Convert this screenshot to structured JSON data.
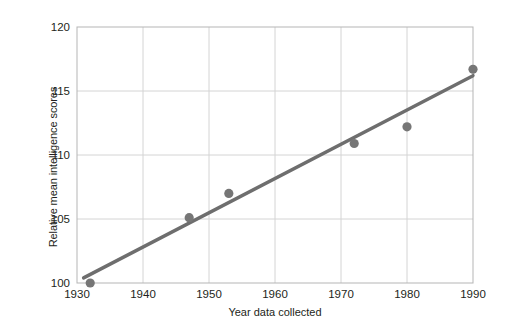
{
  "chart_data": {
    "type": "scatter",
    "title": "",
    "xlabel": "Year data collected",
    "ylabel": "Relative mean intelligence scores",
    "xlim": [
      1930,
      1990
    ],
    "ylim": [
      100,
      120
    ],
    "xticks": [
      1930,
      1940,
      1950,
      1960,
      1970,
      1980,
      1990
    ],
    "yticks": [
      100,
      105,
      110,
      115,
      120
    ],
    "xtick_labels": [
      "1930",
      "1940",
      "1950",
      "1960",
      "1970",
      "1980",
      "1990"
    ],
    "ytick_labels": [
      "100",
      "105",
      "110",
      "115",
      "120"
    ],
    "grid": true,
    "legend": "none",
    "series": [
      {
        "name": "Relative mean intelligence scores",
        "type": "scatter",
        "marker": "circle",
        "color": "#767676",
        "x": [
          1932,
          1947,
          1953,
          1972,
          1980,
          1990
        ],
        "y": [
          100.0,
          105.1,
          107.0,
          110.9,
          112.2,
          116.7
        ]
      },
      {
        "name": "Trend line",
        "type": "line",
        "color": "#6e6e6e",
        "x": [
          1931,
          1990
        ],
        "y": [
          100.4,
          116.2
        ]
      }
    ],
    "colors": {
      "marker": "#767676",
      "line": "#6e6e6e",
      "grid": "#d4d4d4",
      "axis": "#b0b0b0",
      "text": "#231f20",
      "background": "#ffffff"
    }
  }
}
